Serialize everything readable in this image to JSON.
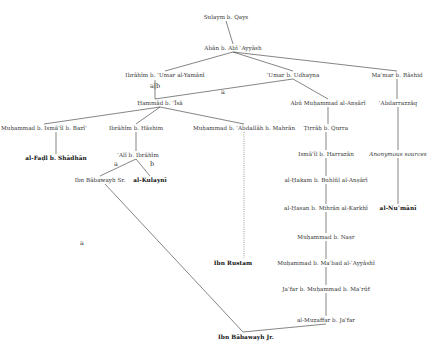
{
  "diagram": {
    "type": "transmission-tree",
    "nodes": {
      "sulaym": "Sulaym b. Qays",
      "aban": "Abān b. Abī ʿAyyāsh",
      "ibrahim_umar": "Ibrāhīm b. ʿUmar al-Yamānī",
      "umar_udhayna": "ʿUmar b. Udhayna",
      "mamar": "Maʿmar b. Rāshid",
      "hammad": "Ḥammād b. ʿĪsā",
      "abu_muhammad": "Abū Muḥammad al-Anṣārī",
      "abdarrazzaq": "ʿAbdarrazzāq",
      "muhammad_ismail": "Muḥammad b. Ismāʿīl b. Bazīʿ",
      "ibrahim_hashim": "Ibrāhīm b. Hāshim",
      "muhammad_abdallah": "Muḥammad b. ʿAbdallāh b. Mahrān",
      "tirrah": "Ṭirrāḥ b. Qurra",
      "fadl": "al-Faḍl b. Shādhān",
      "ali_ibrahim": "ʿAlī b. Ibrāhīm",
      "ismail_harrazan": "Ismāʿīl b. Harrazān",
      "anonymous": "Anonymous sources",
      "ibn_babawayh_sr": "Ibn Bābawayh Sr.",
      "kulayni": "al-Kulaynī",
      "hakam": "al-Ḥakam b. Buhlūl al-Anṣārī",
      "hasan_mihran": "al-Ḥasan b. Mihrān al-Karkhī",
      "numani": "al-Nuʿmānī",
      "muhammad_nasr": "Muḥammad b. Naṣr",
      "ibn_rustam": "Ibn Rustam",
      "muhammad_mabad": "Muḥammad b. Maʿbad al-ʿAyyāshī",
      "jafar_muhammad": "Jaʿfar b. Muḥammad b. Maʿrūf",
      "muzaffar": "al-Muẓaffar b. Jaʿfar",
      "ibn_babawayh_jr": "Ibn Bābawayh Jr."
    },
    "edge_labels": {
      "ab": "a|b",
      "a_hammad": "a",
      "a_ali": "a",
      "b_ali": "b",
      "a_long": "a"
    },
    "colors": {
      "line": "#333333",
      "text": "#333333",
      "background": "#ffffff"
    }
  }
}
